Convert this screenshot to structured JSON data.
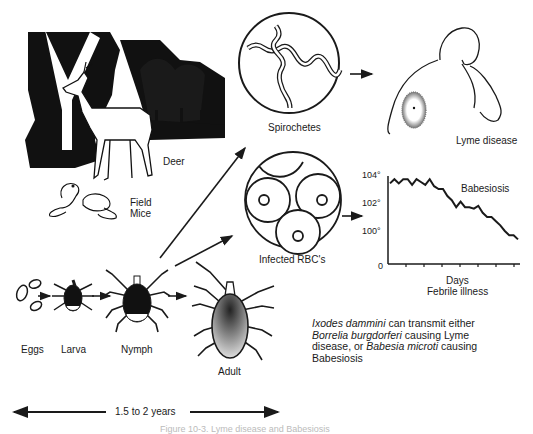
{
  "labels": {
    "deer": "Deer",
    "field_mice_1": "Field",
    "field_mice_2": "Mice",
    "spirochetes": "Spirochetes",
    "lyme_disease": "Lyme disease",
    "infected_rbc": "Infected RBC's",
    "eggs": "Eggs",
    "larva": "Larva",
    "nymph": "Nymph",
    "adult": "Adult",
    "duration": "1.5 to 2 years"
  },
  "description": {
    "line1_italic": "Ixodes dammini",
    "line1_rest": " can transmit either",
    "line2_italic": "Borrelia burgdorferi",
    "line2_rest": " causing Lyme",
    "line3_pre": "disease, or ",
    "line3_italic": "Babesia microti",
    "line3_rest": " causing",
    "line4": "Babesiosis"
  },
  "chart_data": {
    "type": "line",
    "title": "Babesiosis",
    "xlabel": "Days",
    "xlabel2": "Febrile illness",
    "ylabel": "",
    "yticks": [
      "0",
      "100°",
      "102°",
      "104°"
    ],
    "ylim": [
      0,
      104.5
    ],
    "x": [
      0,
      1,
      2,
      3,
      4,
      5,
      6,
      7,
      8,
      9,
      10,
      11,
      12,
      13,
      14,
      15,
      16,
      17,
      18,
      19,
      20,
      21,
      22,
      23,
      24,
      25,
      26,
      27,
      28,
      29
    ],
    "values": [
      103.4,
      103.7,
      103.4,
      103.7,
      103.7,
      103.3,
      103.7,
      103.5,
      103.3,
      103.7,
      103.2,
      103.0,
      103.0,
      102.5,
      102.2,
      101.7,
      102.1,
      101.7,
      101.7,
      101.6,
      101.8,
      101.3,
      101.0,
      101.0,
      100.7,
      100.4,
      100.0,
      99.7,
      99.7,
      99.4
    ],
    "grid": false,
    "annotations": [
      "Babesiosis"
    ]
  },
  "figure_caption": "Figure 10-3. Lyme disease and Babesiosis"
}
